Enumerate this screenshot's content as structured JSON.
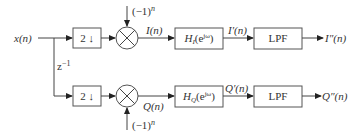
{
  "diagram": {
    "input": "x(n)",
    "delay": "z⁻¹",
    "top": {
      "decimator": "2↓",
      "mixer_input": "(−1)ⁿ",
      "mixer_output": "I(n)",
      "filter": "Hᴵ(eʲᵚ)",
      "filter_output": "I′(n)",
      "lpf": "LPF",
      "output": "I″(n)"
    },
    "bottom": {
      "decimator": "2↓",
      "mixer_input": "(−1)ⁿ",
      "mixer_output": "Q(n)",
      "filter": "H_Q(e^{jω})",
      "filter_output": "Q′(n)",
      "lpf": "LPF",
      "output": "Q″(n)"
    }
  }
}
